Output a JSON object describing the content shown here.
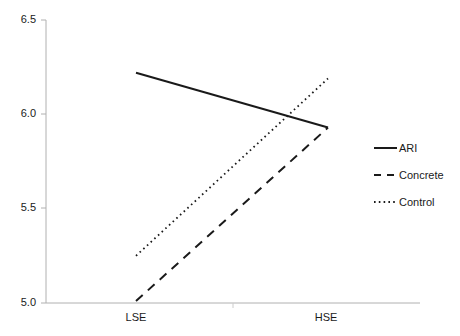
{
  "chart_data": {
    "type": "line",
    "title": "",
    "subtitle": "",
    "xlabel": "",
    "ylabel": "",
    "categories": [
      "LSE",
      "HSE"
    ],
    "x_tick_labels": [
      "LSE",
      "HSE"
    ],
    "y_tick_labels": [
      "6.5",
      "6.0",
      "5.5",
      "5.0"
    ],
    "y_ticks": [
      6.5,
      6.0,
      5.5,
      5.0
    ],
    "ylim": [
      5.0,
      6.5
    ],
    "grid": false,
    "legend_position": "right",
    "series": [
      {
        "name": "ARI",
        "style": "solid",
        "color": "#1a1a1a",
        "values": [
          6.22,
          5.93
        ]
      },
      {
        "name": "Concrete",
        "style": "dashed",
        "color": "#1a1a1a",
        "values": [
          5.01,
          5.93
        ]
      },
      {
        "name": "Control",
        "style": "dotted",
        "color": "#1a1a1a",
        "values": [
          5.25,
          6.19
        ]
      }
    ]
  },
  "axes": {
    "y_labels": [
      {
        "text": "6.5"
      },
      {
        "text": "6.0"
      },
      {
        "text": "5.5"
      },
      {
        "text": "5.0"
      }
    ],
    "x_labels": [
      {
        "text": "LSE"
      },
      {
        "text": "HSE"
      }
    ]
  },
  "legend": {
    "items": [
      {
        "label": "ARI",
        "style": "solid"
      },
      {
        "label": "Concrete",
        "style": "dashed"
      },
      {
        "label": "Control",
        "style": "dotted"
      }
    ]
  },
  "colors": {
    "axis": "#b0b0b0",
    "series": "#1a1a1a",
    "text": "#1a1a1a",
    "background": "#ffffff"
  }
}
